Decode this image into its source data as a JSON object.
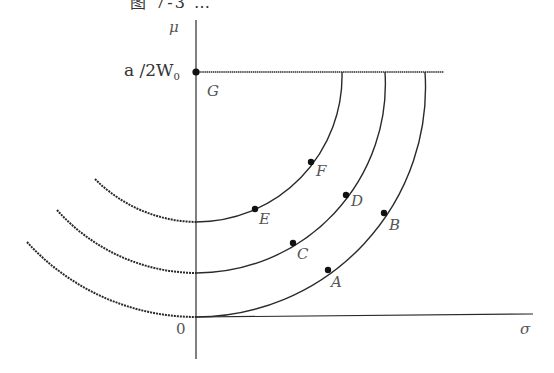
{
  "figure": {
    "title": "图 7-3 …",
    "axes": {
      "y_label": "μ",
      "x_label": "σ",
      "origin_label": "0",
      "y_tick_label_main": "a /2W",
      "y_tick_label_sub": "0"
    },
    "points": {
      "G": "G",
      "A": "A",
      "B": "B",
      "C": "C",
      "D": "D",
      "E": "E",
      "F": "F"
    },
    "colors": {
      "line": "#2a2a2a",
      "label": "#555555"
    }
  }
}
